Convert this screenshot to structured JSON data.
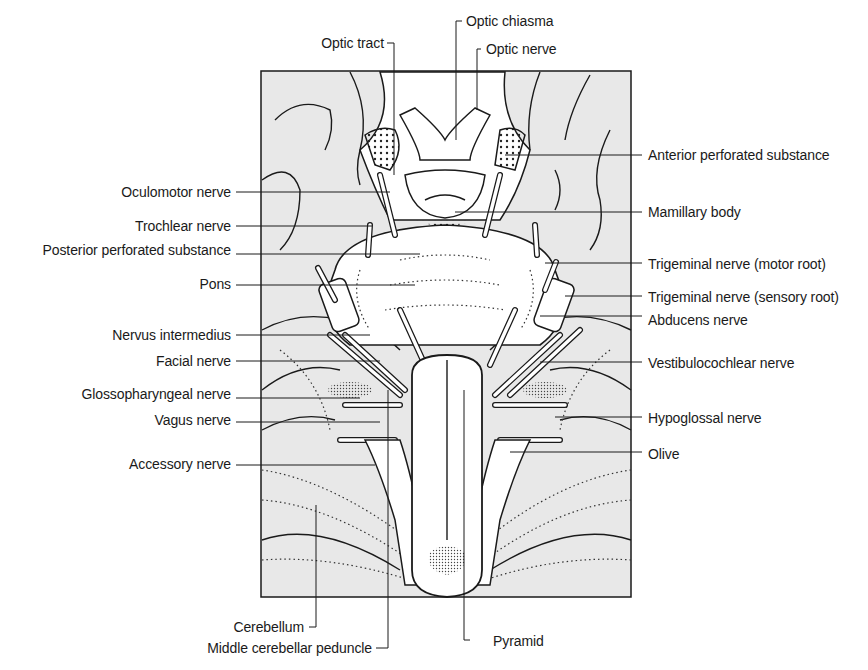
{
  "figure": {
    "colors": {
      "background": "#ffffff",
      "panel_fill": "#e8e8e8",
      "ink": "#1a1a1a",
      "structure_fill": "#ffffff"
    }
  },
  "labels": {
    "top": [
      {
        "id": "optic-chiasma",
        "text": "Optic chiasma"
      },
      {
        "id": "optic-nerve",
        "text": "Optic nerve"
      },
      {
        "id": "optic-tract",
        "text": "Optic tract"
      }
    ],
    "left": [
      {
        "id": "oculomotor-nerve",
        "text": "Oculomotor nerve"
      },
      {
        "id": "trochlear-nerve",
        "text": "Trochlear nerve"
      },
      {
        "id": "posterior-perforated-substance",
        "text": "Posterior perforated substance"
      },
      {
        "id": "pons",
        "text": "Pons"
      },
      {
        "id": "nervus-intermedius",
        "text": "Nervus intermedius"
      },
      {
        "id": "facial-nerve",
        "text": "Facial nerve"
      },
      {
        "id": "glossopharyngeal-nerve",
        "text": "Glossopharyngeal nerve"
      },
      {
        "id": "vagus-nerve",
        "text": "Vagus nerve"
      },
      {
        "id": "accessory-nerve",
        "text": "Accessory nerve"
      }
    ],
    "right": [
      {
        "id": "anterior-perforated-substance",
        "text": "Anterior perforated substance"
      },
      {
        "id": "mamillary-body",
        "text": "Mamillary body"
      },
      {
        "id": "trigeminal-motor-root",
        "text": "Trigeminal nerve (motor root)"
      },
      {
        "id": "trigeminal-sensory-root",
        "text": "Trigeminal nerve (sensory root)"
      },
      {
        "id": "abducens-nerve",
        "text": "Abducens nerve"
      },
      {
        "id": "vestibulocochlear-nerve",
        "text": "Vestibulocochlear nerve"
      },
      {
        "id": "hypoglossal-nerve",
        "text": "Hypoglossal nerve"
      },
      {
        "id": "olive",
        "text": "Olive"
      }
    ],
    "bottom": [
      {
        "id": "cerebellum",
        "text": "Cerebellum"
      },
      {
        "id": "middle-cerebellar-peduncle",
        "text": "Middle cerebellar peduncle"
      },
      {
        "id": "pyramid",
        "text": "Pyramid"
      }
    ]
  }
}
